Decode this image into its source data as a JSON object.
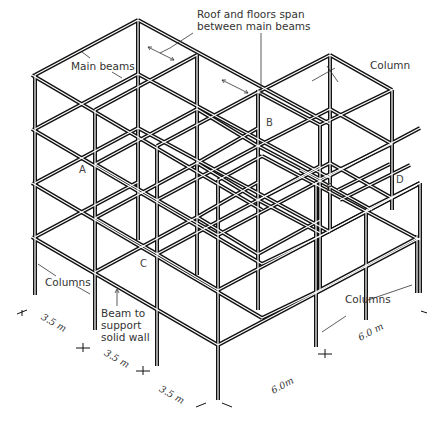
{
  "figure": {
    "type": "isometric steel frame diagram",
    "annotations": {
      "roof_floors": [
        "Roof and floors span",
        "between main beams"
      ],
      "main_beams": "Main beams",
      "column_top": "Column",
      "columns_left": "Columns",
      "columns_right": "Columns",
      "beam_wall": [
        "Beam to",
        "support",
        "solid wall"
      ]
    },
    "points": {
      "A": "A",
      "B": "B",
      "C": "C",
      "D": "D",
      "E": "E"
    },
    "dimensions": {
      "bay_1": "3.5 m",
      "bay_2": "3.5 m",
      "bay_3": "3.5 m",
      "depth_1": "6.0 m",
      "depth_2": "6.0m"
    },
    "colors": {
      "line": "#111111",
      "text": "#333333",
      "background": "#ffffff"
    }
  }
}
